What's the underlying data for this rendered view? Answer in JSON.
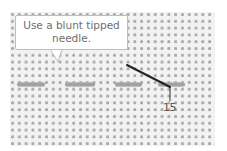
{
  "diagram": {
    "callout": {
      "line1": "Use a blunt tipped",
      "line2": "needle."
    },
    "step_label": "15",
    "stitches": [
      {
        "x": 17,
        "width": 28
      },
      {
        "x": 65,
        "width": 30
      },
      {
        "x": 115,
        "width": 27
      },
      {
        "x": 158,
        "width": 27
      }
    ],
    "colors": {
      "fabric": "#f2f2f2",
      "fabric_holes": "#a8a8a8",
      "thread": "#9a9a9a",
      "needle": "#222222",
      "callout_text": "#6e6e6e"
    }
  }
}
